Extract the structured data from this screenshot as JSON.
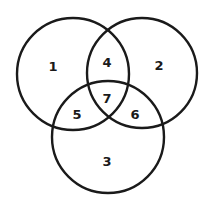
{
  "diagram": {
    "type": "venn",
    "sets": 3,
    "stroke_color": "#1a1a1a",
    "background": "#ffffff",
    "circles": [
      {
        "id": "A",
        "cx": 73,
        "cy": 74,
        "r": 56
      },
      {
        "id": "B",
        "cx": 142,
        "cy": 73,
        "r": 55
      },
      {
        "id": "C",
        "cx": 108,
        "cy": 137,
        "r": 56
      }
    ],
    "regions": [
      {
        "label": "1",
        "x": 53,
        "y": 66
      },
      {
        "label": "2",
        "x": 159,
        "y": 65
      },
      {
        "label": "3",
        "x": 107,
        "y": 161
      },
      {
        "label": "4",
        "x": 107,
        "y": 62
      },
      {
        "label": "5",
        "x": 77,
        "y": 114
      },
      {
        "label": "6",
        "x": 135,
        "y": 114
      },
      {
        "label": "7",
        "x": 107,
        "y": 98
      }
    ]
  }
}
